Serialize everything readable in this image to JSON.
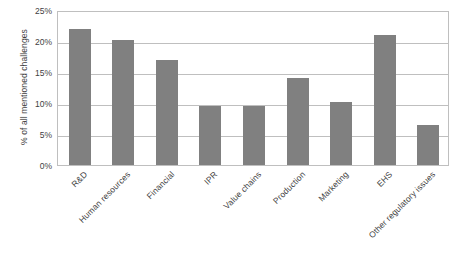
{
  "chart_data": {
    "type": "bar",
    "title": "",
    "subtitle": "",
    "xlabel": "",
    "ylabel": "% of all mentioned challenges",
    "ylim": [
      0,
      25
    ],
    "yunit": "%",
    "grid": true,
    "legend": "none",
    "orientation": "vertical",
    "bar_color": "#808080",
    "gridline_color": "#bfbfbf",
    "background_color": "#ffffff",
    "categories": [
      "R&D",
      "Human resources",
      "Financial",
      "IPR",
      "Value chains",
      "Production",
      "Marketing",
      "EHS",
      "Other regulatory issues"
    ],
    "values": [
      22.0,
      20.2,
      17.0,
      9.5,
      9.5,
      14.0,
      10.2,
      21.0,
      6.5
    ],
    "ytick_labels": [
      "25%",
      "20%",
      "15%",
      "10%",
      "5%",
      "0%"
    ],
    "ytick_values": [
      25,
      20,
      15,
      10,
      5,
      0
    ]
  }
}
